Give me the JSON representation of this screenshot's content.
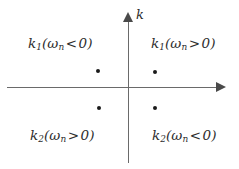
{
  "figure": {
    "background_color": "#ffffff",
    "width": 239,
    "height": 169
  },
  "axes": {
    "vertical_label": "k",
    "horizontal_label": "",
    "line_color": "#6a6a6a",
    "arrow_color": "#4a4a4a",
    "origin": {
      "x": 128,
      "y": 88
    }
  },
  "quadrants": {
    "upper_left": {
      "symbol": "k",
      "symbol_sub": "1",
      "open_paren": "(",
      "omega": "ω",
      "omega_sub": "n",
      "relation": "<",
      "value": "0",
      "close_paren": ")",
      "full_text": "k₁(ωₙ < 0)"
    },
    "upper_right": {
      "symbol": "k",
      "symbol_sub": "1",
      "open_paren": "(",
      "omega": "ω",
      "omega_sub": "n",
      "relation": ">",
      "value": "0",
      "close_paren": ")",
      "full_text": "k₁(ωₙ > 0)"
    },
    "lower_left": {
      "symbol": "k",
      "symbol_sub": "2",
      "open_paren": "(",
      "omega": "ω",
      "omega_sub": "n",
      "relation": ">",
      "value": "0",
      "close_paren": ")",
      "full_text": "k₂(ωₙ > 0)"
    },
    "lower_right": {
      "symbol": "k",
      "symbol_sub": "2",
      "open_paren": "(",
      "omega": "ω",
      "omega_sub": "n",
      "relation": "<",
      "value": "0",
      "close_paren": ")",
      "full_text": "k₂(ωₙ < 0)"
    }
  },
  "points": {
    "color": "#1a1a1a",
    "items": [
      {
        "quadrant": "upper_left",
        "x": 98,
        "y": 71
      },
      {
        "quadrant": "upper_right",
        "x": 155,
        "y": 72
      },
      {
        "quadrant": "lower_left",
        "x": 99,
        "y": 108
      },
      {
        "quadrant": "lower_right",
        "x": 155,
        "y": 108
      }
    ]
  }
}
